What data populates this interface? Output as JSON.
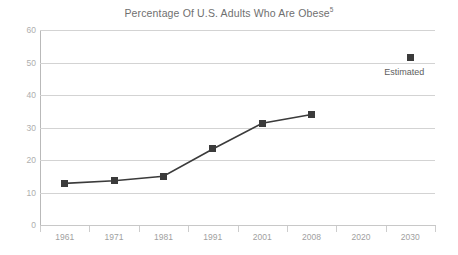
{
  "chart_data": {
    "type": "line",
    "title": "Percentage Of U.S. Adults Who Are Obese",
    "title_superscript": "5",
    "xlabel": "",
    "ylabel": "",
    "ylim": [
      0,
      60
    ],
    "y_ticks": [
      0,
      10,
      20,
      30,
      40,
      50,
      60
    ],
    "grid": true,
    "legend": false,
    "categories": [
      "1961",
      "1971",
      "1981",
      "1991",
      "2001",
      "2008",
      "2020",
      "2030"
    ],
    "series": [
      {
        "name": "Percentage of U.S. adults who are obese",
        "values": [
          12.8,
          13.6,
          15.0,
          23.4,
          31.3,
          34.0,
          null,
          51.5
        ],
        "marker": "square",
        "marker_color": "#3b3b3b",
        "line_color": "#3b3b3b",
        "connected_through_index": 5
      }
    ],
    "annotations": [
      {
        "text": "Estimated",
        "anchor_category": "2030",
        "anchor_value": 51.5,
        "position": "below-right"
      }
    ],
    "colors": {
      "gridline": "#d3d3d3",
      "axis": "#c8c8c8",
      "y_tick_label": "#aeaeae",
      "x_tick_label": "#9f9f9f",
      "title": "#6f6f6f",
      "annotation": "#5e5e5e",
      "background": "#ffffff"
    }
  }
}
